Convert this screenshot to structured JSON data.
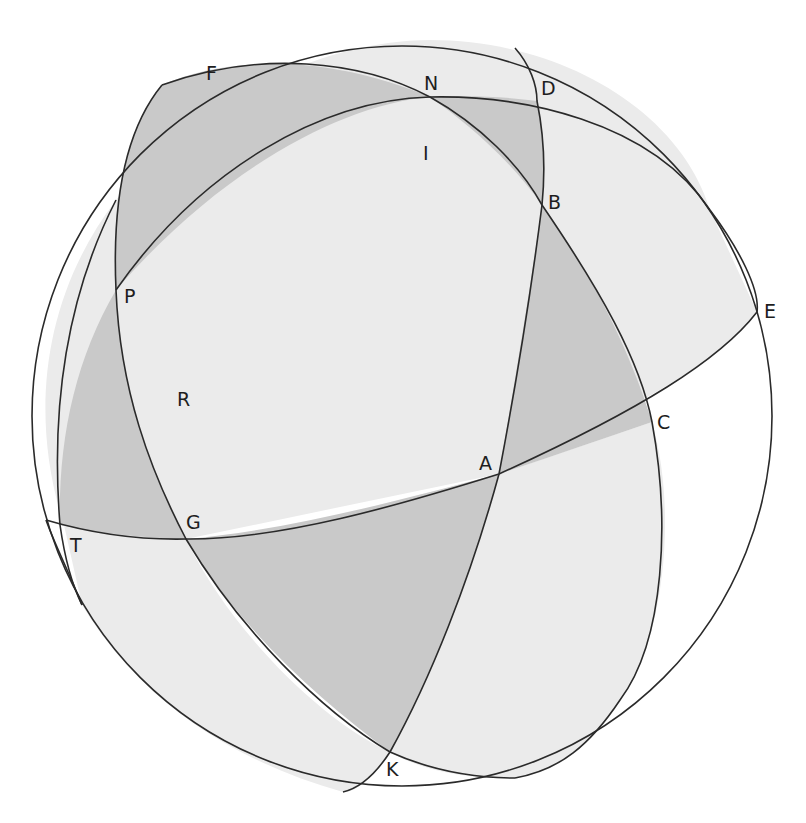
{
  "figure": {
    "type": "spherical-geometry-diagram",
    "colors": {
      "background": "#ffffff",
      "light_shade": "#ebebeb",
      "dark_shade": "#c9c9c9",
      "line": "#2a2a2a",
      "label": "#1e1e1e"
    }
  },
  "points": {
    "F": {
      "label": "F",
      "x": 212,
      "y": 80
    },
    "N": {
      "label": "N",
      "x": 432,
      "y": 90
    },
    "D": {
      "label": "D",
      "x": 548,
      "y": 95
    },
    "I": {
      "label": "I",
      "x": 427,
      "y": 160
    },
    "B": {
      "label": "B",
      "x": 556,
      "y": 209
    },
    "P": {
      "label": "P",
      "x": 130,
      "y": 303
    },
    "E": {
      "label": "E",
      "x": 770,
      "y": 318
    },
    "R": {
      "label": "R",
      "x": 184,
      "y": 406
    },
    "C": {
      "label": "C",
      "x": 664,
      "y": 429
    },
    "A": {
      "label": "A",
      "x": 487,
      "y": 470
    },
    "G": {
      "label": "G",
      "x": 193,
      "y": 529
    },
    "T": {
      "label": "T",
      "x": 76,
      "y": 552
    },
    "K": {
      "label": "K",
      "x": 398,
      "y": 776
    }
  }
}
